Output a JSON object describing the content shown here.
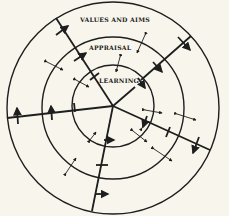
{
  "diagram": {
    "rings": [
      {
        "label": "LEARNING",
        "radius": 40
      },
      {
        "label": "APPRAISAL",
        "radius": 70
      },
      {
        "label": "VALUES AND AIMS",
        "radius": 107
      }
    ],
    "labels": {
      "values": "VALUES AND AIMS",
      "appraisal": "APPRAISAL",
      "learning": "LEARNING"
    },
    "center": {
      "x": 113,
      "y": 106
    },
    "spokes": [
      {
        "name": "upper-left",
        "end": [
          56,
          18
        ]
      },
      {
        "name": "upper-right",
        "end": [
          191,
          36
        ]
      },
      {
        "name": "left",
        "end": [
          7,
          118
        ]
      },
      {
        "name": "down",
        "end": [
          92,
          211
        ]
      },
      {
        "name": "lower-right",
        "end": [
          210,
          150
        ]
      }
    ],
    "colors": {
      "ink": "#1e1e1e",
      "paper": "#f8f6ec"
    }
  }
}
